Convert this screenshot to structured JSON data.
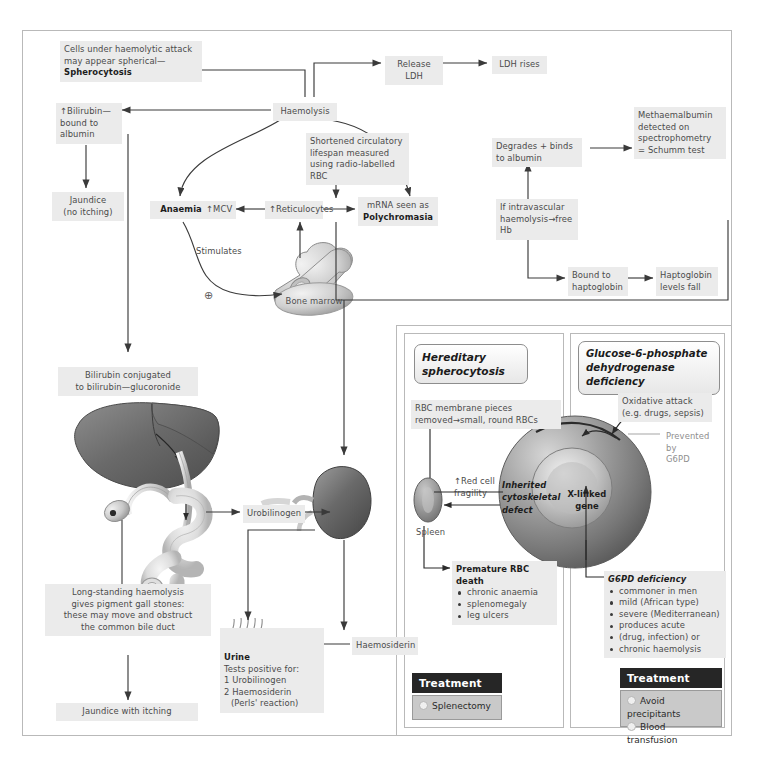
{
  "diagram": {
    "nodes": {
      "spherocytosis_note": "Cells under haemolytic attack may appear spherical—",
      "spherocytosis_bold": "Spherocytosis",
      "release_ldh": "Release LDH",
      "ldh_rises": "LDH rises",
      "haemolysis": "Haemolysis",
      "bilirubin": "↑Bilirubin—bound to albumin",
      "bilirubin_l1": "↑Bilirubin—",
      "bilirubin_l2": "bound to",
      "bilirubin_l3": "albumin",
      "jaundice_no_itching_l1": "Jaundice",
      "jaundice_no_itching_l2": "(no itching)",
      "anaemia": "Anaemia",
      "mcv": "↑MCV",
      "reticulocytes": "↑Reticulocytes",
      "mrna_l1": "mRNA seen as",
      "mrna_bold": "Polychromasia",
      "shortened_l1": "Shortened circulatory",
      "shortened_l2": "lifespan measured",
      "shortened_l3": "using radio-labelled RBC",
      "stimulates": "Stimulates",
      "plus_sign": "⊕",
      "bone_marrow": "Bone marrow",
      "intravascular_l1": "If intravascular",
      "intravascular_l2": "haemolysis→free Hb",
      "degrades_l1": "Degrades + binds",
      "degrades_l2": "to albumin",
      "methaemalbumin_l1": "Methaemalbumin",
      "methaemalbumin_l2": "detected on",
      "methaemalbumin_l3": "spectrophometry",
      "methaemalbumin_l4": "= Schumm test",
      "bound_haptoglobin_l1": "Bound to",
      "bound_haptoglobin_l2": "haptoglobin",
      "haptoglobin_fall_l1": "Haptoglobin",
      "haptoglobin_fall_l2": "levels fall",
      "bilirubin_conj_l1": "Bilirubin conjugated",
      "bilirubin_conj_l2": "to bilirubin—glucoronide",
      "urobilinogen": "Urobilinogen",
      "haemosiderin": "Haemosiderin",
      "long_standing_l1": "Long-standing haemolysis",
      "long_standing_l2": "gives pigment gall stones:",
      "long_standing_l3": "these may move and obstruct",
      "long_standing_l4": "the common bile duct",
      "jaundice_itching": "Jaundice with itching",
      "urine_title": "Urine",
      "urine_l1": "Tests positive for:",
      "urine_l2": "1 Urobilinogen",
      "urine_l3": "2 Haemosiderin",
      "urine_l4": "(Perls' reaction)"
    },
    "hereditary_spherocytosis": {
      "title_l1": "Hereditary",
      "title_l2": "spherocytosis",
      "rbc_membrane_l1": "RBC membrane pieces",
      "rbc_membrane_l2": "removed→small, round RBCs",
      "red_cell_l1": "↑Red cell",
      "red_cell_l2": "fragility",
      "spleen": "Spleen",
      "inherited_l1": "Inherited",
      "inherited_l2": "cytoskeletal",
      "inherited_l3": "defect",
      "premature_l1": "Premature RBC",
      "premature_l2": "death",
      "premature_bullets": [
        "chronic anaemia",
        "splenomegaly",
        "leg ulcers"
      ],
      "treatment_label": "Treatment",
      "treatment_items": [
        "Splenectomy"
      ]
    },
    "g6pd": {
      "title_l1": "Glucose-6-phosphate",
      "title_l2": "dehydrogenase deficiency",
      "oxidative_l1": "Oxidative attack",
      "oxidative_l2": "(e.g. drugs, sepsis)",
      "prevented_l1": "Prevented by",
      "prevented_l2": "G6PD",
      "xlinked_l1": "X-linked",
      "xlinked_l2": "gene",
      "deficiency_title": "G6PD deficiency",
      "deficiency_bullets": [
        "commoner in men",
        "mild (African type)",
        "severe (Mediterranean)",
        "produces acute",
        "(drug, infection) or",
        "chronic haemolysis"
      ],
      "treatment_label": "Treatment",
      "treatment_items": [
        "Avoid precipitants",
        "Blood transfusion"
      ]
    },
    "colors": {
      "box_bg": "#ebebeb",
      "frame": "#b9b9b9",
      "arrow": "#3a3a3a",
      "treatment_header_bg": "#262626",
      "treatment_body_bg": "#c9c9c9",
      "organ_dark": "#6d6d6d",
      "organ_light": "#d3d3d3"
    },
    "icons": [
      "bone-icon",
      "liver-icon",
      "gallbladder-icon",
      "kidney-icon",
      "urine-cup-icon",
      "red-blood-cell-icon",
      "spherocyte-icon"
    ]
  }
}
